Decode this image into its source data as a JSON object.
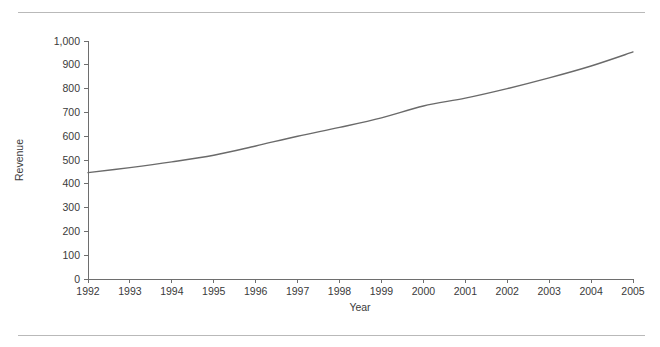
{
  "figure": {
    "clipped_caption_above": "",
    "rule_color": "#b9b9b9"
  },
  "chart_data": {
    "type": "line",
    "title": "",
    "subtitle": "",
    "xlabel": "Year",
    "ylabel": "Revenue",
    "categories": [
      "1992",
      "1993",
      "1994",
      "1995",
      "1996",
      "1997",
      "1998",
      "1999",
      "2000",
      "2001",
      "2002",
      "2003",
      "2004",
      "2005"
    ],
    "x": [
      1992,
      1993,
      1994,
      1995,
      1996,
      1997,
      1998,
      1999,
      2000,
      2001,
      2002,
      2003,
      2004,
      2005
    ],
    "values": [
      447,
      468,
      492,
      520,
      559,
      600,
      637,
      677,
      727,
      760,
      800,
      845,
      895,
      954
    ],
    "series": [
      {
        "name": "Revenue",
        "color": "#6a6a6a",
        "values": [
          447,
          468,
          492,
          520,
          559,
          600,
          637,
          677,
          727,
          760,
          800,
          845,
          895,
          954
        ]
      }
    ],
    "xlim": [
      1992,
      2005
    ],
    "ylim": [
      0,
      1000
    ],
    "ytick_values": [
      0,
      100,
      200,
      300,
      400,
      500,
      600,
      700,
      800,
      900,
      1000
    ],
    "ytick_labels": [
      "0",
      "100",
      "200",
      "300",
      "400",
      "500",
      "600",
      "700",
      "800",
      "900",
      "1,000"
    ],
    "xtick_labels": [
      "1992",
      "1993",
      "1994",
      "1995",
      "1996",
      "1997",
      "1998",
      "1999",
      "2000",
      "2001",
      "2002",
      "2003",
      "2004",
      "2005"
    ],
    "grid": false,
    "legend": false,
    "legend_position": "none",
    "annotations": []
  }
}
